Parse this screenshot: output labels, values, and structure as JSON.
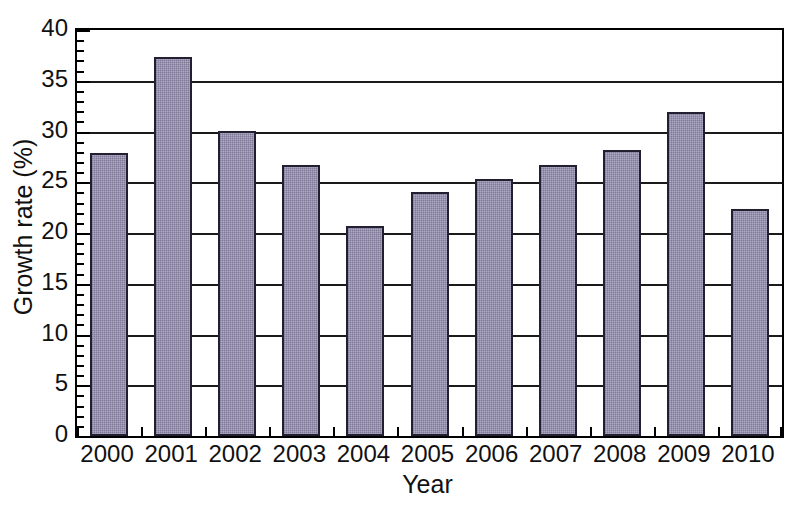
{
  "chart_data": {
    "type": "bar",
    "title": "",
    "xlabel": "Year",
    "ylabel": "Growth rate (%)",
    "categories": [
      "2000",
      "2001",
      "2002",
      "2003",
      "2004",
      "2005",
      "2006",
      "2007",
      "2008",
      "2009",
      "2010"
    ],
    "values": [
      27.9,
      37.3,
      30.1,
      26.7,
      20.7,
      24.0,
      25.3,
      26.7,
      28.2,
      31.9,
      22.4
    ],
    "ylim": [
      0,
      40
    ],
    "y_major_ticks": [
      0,
      5,
      10,
      15,
      20,
      25,
      30,
      35,
      40
    ],
    "y_major_tick_labels": [
      "0",
      "5",
      "10",
      "15",
      "20",
      "25",
      "30",
      "35",
      "40"
    ],
    "y_minor_tick_interval": 1,
    "grid": true,
    "grid_axis": "y",
    "legend": false,
    "legend_position": "none",
    "bar_color": "#8d86a9",
    "bar_edge_color": "#222030",
    "plot_background": "#ffffff",
    "frame": true
  }
}
